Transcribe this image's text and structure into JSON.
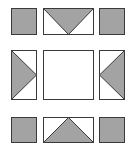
{
  "diagram": {
    "colors": {
      "fill": "#a3a3a3",
      "stroke": "#3a3a3a",
      "background": "#ffffff"
    },
    "tiles": [
      {
        "id": "top-left",
        "type": "filled-square",
        "x": 11,
        "y": 8,
        "w": 25,
        "h": 26
      },
      {
        "id": "top-middle",
        "type": "triangle-down",
        "x": 43,
        "y": 8,
        "w": 50,
        "h": 26
      },
      {
        "id": "top-right",
        "type": "filled-square",
        "x": 99,
        "y": 8,
        "w": 25,
        "h": 26
      },
      {
        "id": "middle-left",
        "type": "triangle-right",
        "x": 11,
        "y": 50,
        "w": 25,
        "h": 50
      },
      {
        "id": "center",
        "type": "empty-square",
        "x": 43,
        "y": 50,
        "w": 50,
        "h": 50
      },
      {
        "id": "middle-right",
        "type": "triangle-left",
        "x": 99,
        "y": 50,
        "w": 25,
        "h": 50
      },
      {
        "id": "bottom-left",
        "type": "filled-square",
        "x": 11,
        "y": 117,
        "w": 25,
        "h": 26
      },
      {
        "id": "bottom-middle",
        "type": "triangle-up",
        "x": 43,
        "y": 117,
        "w": 50,
        "h": 26
      },
      {
        "id": "bottom-right",
        "type": "filled-square",
        "x": 99,
        "y": 117,
        "w": 25,
        "h": 26
      }
    ]
  }
}
